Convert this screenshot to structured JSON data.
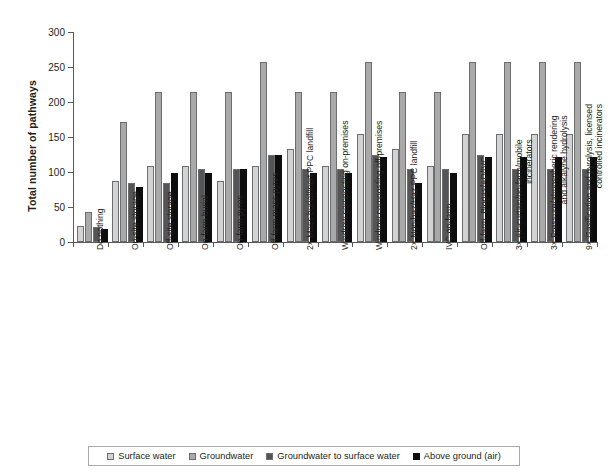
{
  "chart_data": {
    "type": "bar",
    "title": "",
    "xlabel": "",
    "ylabel": "Total number of pathways",
    "ylim": [
      0,
      300
    ],
    "ytick_values": [
      0,
      50,
      100,
      150,
      200,
      250,
      300
    ],
    "ytick_labels": [
      "0",
      "50",
      "100",
      "150",
      "200",
      "250",
      "300"
    ],
    "grid": false,
    "legend_position": "bottom",
    "categories": [
      "Do nothing",
      "On-site storage",
      "Off-site storage",
      "On-farm burial",
      "On-farm pyres",
      "Off-farm mass pyres",
      "2× Mass burial/inert PPC landfill",
      "Windrow composting on-premises",
      "Windrow composting off-premises",
      "2× Non-haz/Haz PPC landfill",
      "IVC on-farm",
      "Off-farm, Biogas/AD/IVC",
      "3× Air-curtain/on-farm/mobile\nincinerators",
      "3× Pressure/atmospheric rendering\nand alkalyne hydrolysis",
      "9× Gasification and pyrolysis, licensed\ncontrolled incinerators"
    ],
    "series": [
      {
        "name": "Surface water",
        "color": "#d3d3d3",
        "values": [
          23,
          87,
          109,
          109,
          87,
          109,
          133,
          109,
          154,
          133,
          109,
          154,
          154,
          154,
          154
        ]
      },
      {
        "name": "Groundwater",
        "color": "#a9a9a9",
        "values": [
          43,
          171,
          214,
          214,
          214,
          257,
          214,
          214,
          257,
          214,
          214,
          257,
          257,
          257,
          257
        ]
      },
      {
        "name": "Groundwater to surface water",
        "color": "#555557",
        "values": [
          21,
          84,
          84,
          104,
          104,
          124,
          104,
          104,
          124,
          104,
          104,
          124,
          104,
          104,
          104
        ]
      },
      {
        "name": "Above ground (air)",
        "color": "#0d0d0d",
        "values": [
          19,
          79,
          99,
          99,
          104,
          124,
          99,
          99,
          121,
          85,
          99,
          121,
          121,
          121,
          121
        ]
      }
    ]
  },
  "legend": {
    "items": [
      {
        "label": "Surface water"
      },
      {
        "label": "Groundwater"
      },
      {
        "label": "Groundwater to surface water"
      },
      {
        "label": "Above ground (air)"
      }
    ]
  }
}
